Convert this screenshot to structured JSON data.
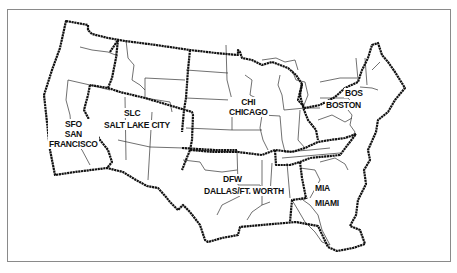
{
  "map": {
    "title": "",
    "regions": [
      {
        "id": "sfo",
        "code": "SFO",
        "name_line1": "SAN",
        "name_line2": "FRANCISCO"
      },
      {
        "id": "slc",
        "code": "SLC",
        "name": "SALT LAKE CITY"
      },
      {
        "id": "chi",
        "code": "CHI",
        "name": "CHICAGO"
      },
      {
        "id": "bos",
        "code": "BOS",
        "name": "BOSTON"
      },
      {
        "id": "dfw",
        "code": "DFW",
        "name": "DALLAS/FT. WORTH"
      },
      {
        "id": "mia",
        "code": "MIA",
        "name": "MIAMI"
      }
    ],
    "colors": {
      "background": "#ffffff",
      "region_border": "#111111",
      "state_border": "#333333",
      "frame": "#8a8a8a"
    }
  }
}
